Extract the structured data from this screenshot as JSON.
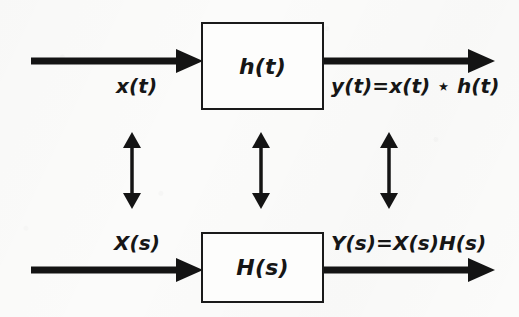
{
  "figure": {
    "background_color": "#fbfbfa",
    "ink_color": "#141414"
  },
  "diagram": {
    "rows": [
      {
        "id": "time-domain",
        "block_label": "h(t)",
        "input_label": "x(t)",
        "output_label": "y(t)=x(t) ⋆ h(t)"
      },
      {
        "id": "s-domain",
        "block_label": "H(s)",
        "input_label": "X(s)",
        "output_label": "Y(s)=X(s)H(s)"
      }
    ],
    "vertical_links": [
      {
        "id": "input-correspondence",
        "label": ""
      },
      {
        "id": "block-correspondence",
        "label": ""
      },
      {
        "id": "output-correspondence",
        "label": ""
      }
    ]
  }
}
